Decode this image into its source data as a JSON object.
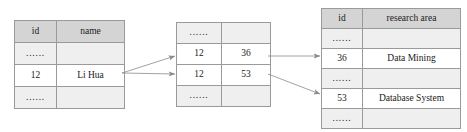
{
  "diagram": {
    "ellipsis": "......",
    "colors": {
      "header_fill": "#d4d4d4",
      "ellipsis_fill": "#efefef",
      "data_fill": "#ffffff",
      "border": "#9a9a9a",
      "connector": "#808080",
      "text": "#1a1a1a",
      "background": "#ffffff"
    },
    "tables": [
      {
        "name": "student-table",
        "headers": [
          "id",
          "name"
        ],
        "rows": [
          {
            "type": "ellipsis",
            "cells": [
              "......",
              ""
            ]
          },
          {
            "type": "data",
            "cells": [
              "12",
              "Li Hua"
            ]
          },
          {
            "type": "ellipsis",
            "cells": [
              "......",
              ""
            ]
          }
        ]
      },
      {
        "name": "relation-table",
        "headers": [],
        "rows": [
          {
            "type": "ellipsis",
            "cells": [
              "......",
              ""
            ]
          },
          {
            "type": "data",
            "cells": [
              "12",
              "36"
            ]
          },
          {
            "type": "data",
            "cells": [
              "12",
              "53"
            ]
          },
          {
            "type": "ellipsis",
            "cells": [
              "......",
              ""
            ]
          }
        ]
      },
      {
        "name": "research-area-table",
        "headers": [
          "id",
          "research area"
        ],
        "rows": [
          {
            "type": "ellipsis",
            "cells": [
              "......",
              ""
            ]
          },
          {
            "type": "data",
            "cells": [
              "36",
              "Data Mining"
            ]
          },
          {
            "type": "ellipsis",
            "cells": [
              "......",
              ""
            ]
          },
          {
            "type": "data",
            "cells": [
              "53",
              "Database System"
            ]
          },
          {
            "type": "ellipsis",
            "cells": [
              "......",
              ""
            ]
          }
        ]
      }
    ],
    "connectors": [
      {
        "name": "student-12-to-relation-12-36",
        "from": [
          122,
          73
        ],
        "to": [
          175,
          56
        ]
      },
      {
        "name": "student-12-to-relation-12-53",
        "from": [
          122,
          73
        ],
        "to": [
          175,
          74
        ]
      },
      {
        "name": "relation-36-to-research-36",
        "from": [
          268,
          56
        ],
        "to": [
          320,
          56
        ]
      },
      {
        "name": "relation-53-to-research-53",
        "from": [
          268,
          74
        ],
        "to": [
          320,
          94
        ]
      }
    ]
  }
}
